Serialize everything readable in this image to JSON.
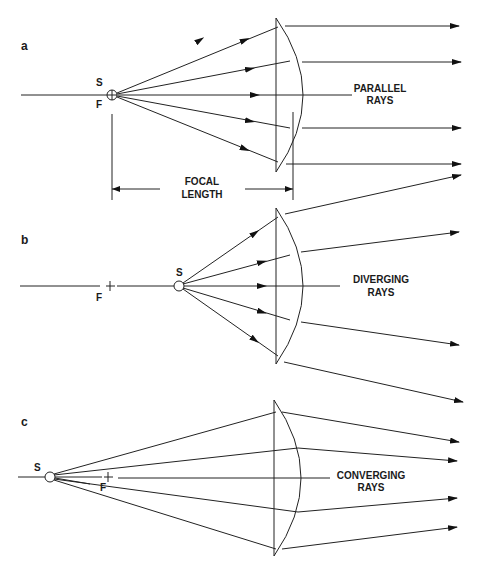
{
  "figure": {
    "panels": [
      {
        "id": "a",
        "label": "a",
        "source_label": "S",
        "focus_label": "F",
        "caption_line1": "PARALLEL",
        "caption_line2": "RAYS",
        "dimension_line1": "FOCAL",
        "dimension_line2": "LENGTH"
      },
      {
        "id": "b",
        "label": "b",
        "source_label": "S",
        "focus_label": "F",
        "caption_line1": "DIVERGING",
        "caption_line2": "RAYS"
      },
      {
        "id": "c",
        "label": "c",
        "source_label": "S",
        "focus_label": "F",
        "caption_line1": "CONVERGING",
        "caption_line2": "RAYS"
      }
    ],
    "colors": {
      "line": "#222222",
      "text": "#1a1a1a",
      "background": "#ffffff"
    }
  }
}
